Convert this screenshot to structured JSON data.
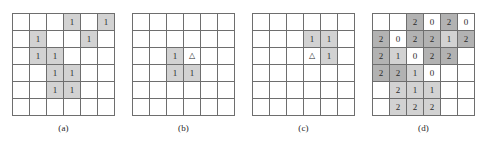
{
  "figure": {
    "panel_count": 4,
    "colors": {
      "grid_line": "#6e6e6e",
      "cell_empty": "#ffffff",
      "cell_light": "#d2d2d2",
      "cell_dark": "#b2b2b2",
      "text": "#2b2b2b",
      "background": "#ffffff"
    }
  },
  "panels": [
    {
      "id": "panel-a",
      "caption": "(a)",
      "left": 12,
      "rows": 6,
      "cols": 6,
      "cells": [
        [
          {
            "value": "",
            "shade": "none"
          },
          {
            "value": "",
            "shade": "none"
          },
          {
            "value": "",
            "shade": "none"
          },
          {
            "value": "1",
            "shade": "light"
          },
          {
            "value": "",
            "shade": "none"
          },
          {
            "value": "1",
            "shade": "light"
          }
        ],
        [
          {
            "value": "",
            "shade": "none"
          },
          {
            "value": "1",
            "shade": "light"
          },
          {
            "value": "",
            "shade": "none"
          },
          {
            "value": "",
            "shade": "none"
          },
          {
            "value": "1",
            "shade": "light"
          },
          {
            "value": "",
            "shade": "none"
          }
        ],
        [
          {
            "value": "",
            "shade": "none"
          },
          {
            "value": "1",
            "shade": "light"
          },
          {
            "value": "1",
            "shade": "light"
          },
          {
            "value": "",
            "shade": "none"
          },
          {
            "value": "",
            "shade": "none"
          },
          {
            "value": "",
            "shade": "none"
          }
        ],
        [
          {
            "value": "",
            "shade": "none"
          },
          {
            "value": "",
            "shade": "none"
          },
          {
            "value": "1",
            "shade": "light"
          },
          {
            "value": "1",
            "shade": "light"
          },
          {
            "value": "",
            "shade": "none"
          },
          {
            "value": "",
            "shade": "none"
          }
        ],
        [
          {
            "value": "",
            "shade": "none"
          },
          {
            "value": "",
            "shade": "none"
          },
          {
            "value": "1",
            "shade": "light"
          },
          {
            "value": "1",
            "shade": "light"
          },
          {
            "value": "",
            "shade": "none"
          },
          {
            "value": "",
            "shade": "none"
          }
        ],
        [
          {
            "value": "",
            "shade": "none"
          },
          {
            "value": "",
            "shade": "none"
          },
          {
            "value": "",
            "shade": "none"
          },
          {
            "value": "",
            "shade": "none"
          },
          {
            "value": "",
            "shade": "none"
          },
          {
            "value": "",
            "shade": "none"
          }
        ]
      ]
    },
    {
      "id": "panel-b",
      "caption": "(b)",
      "left": 132,
      "rows": 6,
      "cols": 6,
      "cells": [
        [
          {
            "value": "",
            "shade": "none"
          },
          {
            "value": "",
            "shade": "none"
          },
          {
            "value": "",
            "shade": "none"
          },
          {
            "value": "",
            "shade": "none"
          },
          {
            "value": "",
            "shade": "none"
          },
          {
            "value": "",
            "shade": "none"
          }
        ],
        [
          {
            "value": "",
            "shade": "none"
          },
          {
            "value": "",
            "shade": "none"
          },
          {
            "value": "",
            "shade": "none"
          },
          {
            "value": "",
            "shade": "none"
          },
          {
            "value": "",
            "shade": "none"
          },
          {
            "value": "",
            "shade": "none"
          }
        ],
        [
          {
            "value": "",
            "shade": "none"
          },
          {
            "value": "",
            "shade": "none"
          },
          {
            "value": "1",
            "shade": "light"
          },
          {
            "value": "△",
            "shade": "none"
          },
          {
            "value": "",
            "shade": "none"
          },
          {
            "value": "",
            "shade": "none"
          }
        ],
        [
          {
            "value": "",
            "shade": "none"
          },
          {
            "value": "",
            "shade": "none"
          },
          {
            "value": "1",
            "shade": "light"
          },
          {
            "value": "1",
            "shade": "light"
          },
          {
            "value": "",
            "shade": "none"
          },
          {
            "value": "",
            "shade": "none"
          }
        ],
        [
          {
            "value": "",
            "shade": "none"
          },
          {
            "value": "",
            "shade": "none"
          },
          {
            "value": "",
            "shade": "none"
          },
          {
            "value": "",
            "shade": "none"
          },
          {
            "value": "",
            "shade": "none"
          },
          {
            "value": "",
            "shade": "none"
          }
        ],
        [
          {
            "value": "",
            "shade": "none"
          },
          {
            "value": "",
            "shade": "none"
          },
          {
            "value": "",
            "shade": "none"
          },
          {
            "value": "",
            "shade": "none"
          },
          {
            "value": "",
            "shade": "none"
          },
          {
            "value": "",
            "shade": "none"
          }
        ]
      ]
    },
    {
      "id": "panel-c",
      "caption": "(c)",
      "left": 252,
      "rows": 6,
      "cols": 6,
      "cells": [
        [
          {
            "value": "",
            "shade": "none"
          },
          {
            "value": "",
            "shade": "none"
          },
          {
            "value": "",
            "shade": "none"
          },
          {
            "value": "",
            "shade": "none"
          },
          {
            "value": "",
            "shade": "none"
          },
          {
            "value": "",
            "shade": "none"
          }
        ],
        [
          {
            "value": "",
            "shade": "none"
          },
          {
            "value": "",
            "shade": "none"
          },
          {
            "value": "",
            "shade": "none"
          },
          {
            "value": "1",
            "shade": "light"
          },
          {
            "value": "1",
            "shade": "light"
          },
          {
            "value": "",
            "shade": "none"
          }
        ],
        [
          {
            "value": "",
            "shade": "none"
          },
          {
            "value": "",
            "shade": "none"
          },
          {
            "value": "",
            "shade": "none"
          },
          {
            "value": "△",
            "shade": "none"
          },
          {
            "value": "1",
            "shade": "light"
          },
          {
            "value": "",
            "shade": "none"
          }
        ],
        [
          {
            "value": "",
            "shade": "none"
          },
          {
            "value": "",
            "shade": "none"
          },
          {
            "value": "",
            "shade": "none"
          },
          {
            "value": "",
            "shade": "none"
          },
          {
            "value": "",
            "shade": "none"
          },
          {
            "value": "",
            "shade": "none"
          }
        ],
        [
          {
            "value": "",
            "shade": "none"
          },
          {
            "value": "",
            "shade": "none"
          },
          {
            "value": "",
            "shade": "none"
          },
          {
            "value": "",
            "shade": "none"
          },
          {
            "value": "",
            "shade": "none"
          },
          {
            "value": "",
            "shade": "none"
          }
        ],
        [
          {
            "value": "",
            "shade": "none"
          },
          {
            "value": "",
            "shade": "none"
          },
          {
            "value": "",
            "shade": "none"
          },
          {
            "value": "",
            "shade": "none"
          },
          {
            "value": "",
            "shade": "none"
          },
          {
            "value": "",
            "shade": "none"
          }
        ]
      ]
    },
    {
      "id": "panel-d",
      "caption": "(d)",
      "left": 372,
      "rows": 6,
      "cols": 6,
      "cells": [
        [
          {
            "value": "",
            "shade": "none"
          },
          {
            "value": "",
            "shade": "none"
          },
          {
            "value": "2",
            "shade": "dark"
          },
          {
            "value": "0",
            "shade": "none"
          },
          {
            "value": "2",
            "shade": "dark"
          },
          {
            "value": "0",
            "shade": "none"
          }
        ],
        [
          {
            "value": "2",
            "shade": "dark"
          },
          {
            "value": "0",
            "shade": "none"
          },
          {
            "value": "2",
            "shade": "dark"
          },
          {
            "value": "2",
            "shade": "dark"
          },
          {
            "value": "1",
            "shade": "light"
          },
          {
            "value": "2",
            "shade": "dark"
          }
        ],
        [
          {
            "value": "2",
            "shade": "dark"
          },
          {
            "value": "1",
            "shade": "light"
          },
          {
            "value": "0",
            "shade": "none"
          },
          {
            "value": "2",
            "shade": "dark"
          },
          {
            "value": "2",
            "shade": "dark"
          },
          {
            "value": "",
            "shade": "none"
          }
        ],
        [
          {
            "value": "2",
            "shade": "dark"
          },
          {
            "value": "2",
            "shade": "dark"
          },
          {
            "value": "1",
            "shade": "light"
          },
          {
            "value": "0",
            "shade": "none"
          },
          {
            "value": "",
            "shade": "none"
          },
          {
            "value": "",
            "shade": "none"
          }
        ],
        [
          {
            "value": "",
            "shade": "none"
          },
          {
            "value": "2",
            "shade": "light"
          },
          {
            "value": "1",
            "shade": "light"
          },
          {
            "value": "1",
            "shade": "light"
          },
          {
            "value": "",
            "shade": "none"
          },
          {
            "value": "",
            "shade": "none"
          }
        ],
        [
          {
            "value": "",
            "shade": "none"
          },
          {
            "value": "2",
            "shade": "light"
          },
          {
            "value": "2",
            "shade": "light"
          },
          {
            "value": "2",
            "shade": "light"
          },
          {
            "value": "",
            "shade": "none"
          },
          {
            "value": "",
            "shade": "none"
          }
        ]
      ]
    }
  ]
}
